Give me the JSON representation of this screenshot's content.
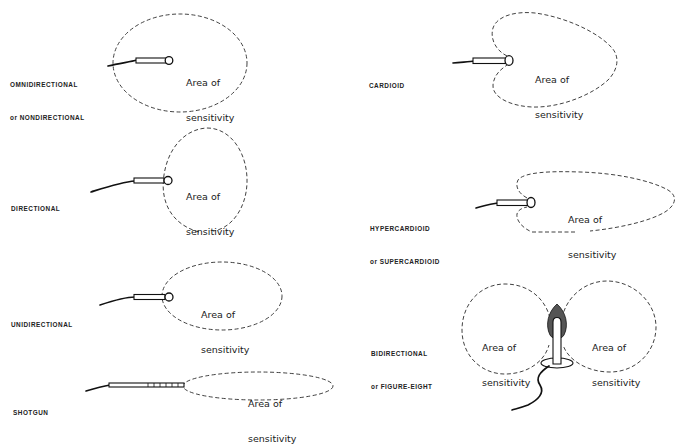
{
  "diagram": {
    "area_label_line1": "Area of",
    "area_label_line2": "sensitivity",
    "patterns": [
      {
        "id": "omnidirectional",
        "label_line1": "OMNIDIRECTIONAL",
        "label_line2": "or NONDIRECTIONAL"
      },
      {
        "id": "directional",
        "label_line1": "DIRECTIONAL",
        "label_line2": ""
      },
      {
        "id": "unidirectional",
        "label_line1": "UNIDIRECTIONAL",
        "label_line2": ""
      },
      {
        "id": "shotgun",
        "label_line1": "SHOTGUN",
        "label_line2": ""
      },
      {
        "id": "cardioid",
        "label_line1": "CARDIOID",
        "label_line2": ""
      },
      {
        "id": "hypercardioid",
        "label_line1": "HYPERCARDIOID",
        "label_line2": "or SUPERCARDIOID"
      },
      {
        "id": "bidirectional",
        "label_line1": "BIDIRECTIONAL",
        "label_line2": "or FIGURE-EIGHT"
      }
    ],
    "colors": {
      "line": "#1a1a1a",
      "background": "#ffffff"
    }
  }
}
